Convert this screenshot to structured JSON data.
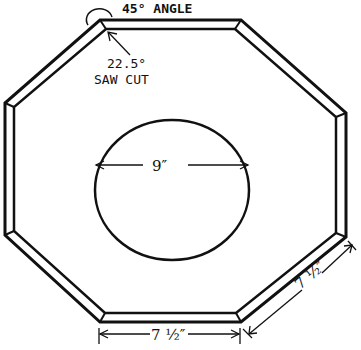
{
  "diagram": {
    "type": "octagon-frame-plan",
    "annotations": {
      "angle_label": "45° ANGLE",
      "saw_cut_value": "22.5°",
      "saw_cut_label": "SAW CUT",
      "circle_diameter": "9″",
      "bottom_side_length": "7 ½″",
      "diagonal_side_length": "7 ½″"
    },
    "colors": {
      "stroke": "#111111",
      "background": "#ffffff"
    }
  }
}
